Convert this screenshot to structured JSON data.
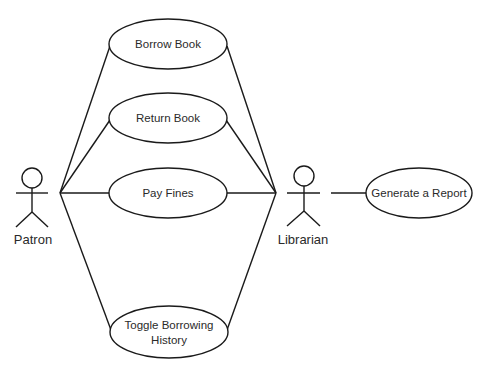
{
  "diagram": {
    "type": "use-case",
    "actors": [
      {
        "id": "patron",
        "label": "Patron"
      },
      {
        "id": "librarian",
        "label": "Librarian"
      }
    ],
    "use_cases": [
      {
        "id": "borrow",
        "label": "Borrow Book"
      },
      {
        "id": "return",
        "label": "Return Book"
      },
      {
        "id": "fines",
        "label": "Pay Fines"
      },
      {
        "id": "toggle",
        "label_line1": "Toggle Borrowing",
        "label_line2": "History"
      },
      {
        "id": "report",
        "label": "Generate a Report"
      }
    ],
    "associations": [
      [
        "patron",
        "borrow"
      ],
      [
        "patron",
        "return"
      ],
      [
        "patron",
        "fines"
      ],
      [
        "patron",
        "toggle"
      ],
      [
        "librarian",
        "borrow"
      ],
      [
        "librarian",
        "return"
      ],
      [
        "librarian",
        "fines"
      ],
      [
        "librarian",
        "toggle"
      ],
      [
        "librarian",
        "report"
      ]
    ]
  }
}
